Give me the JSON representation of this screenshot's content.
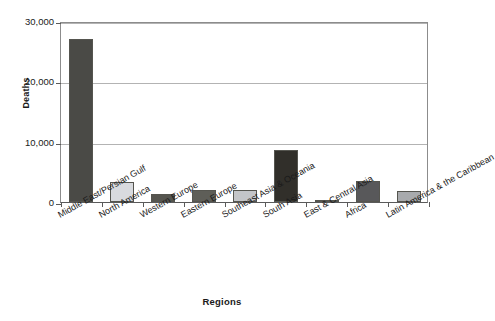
{
  "chart_data": {
    "type": "bar",
    "title": "",
    "xlabel": "Regions",
    "ylabel": "Deaths",
    "ylim": [
      0,
      30000
    ],
    "yticks": [
      0,
      10000,
      20000,
      30000
    ],
    "ytick_labels": [
      "0",
      "10,000",
      "20,000",
      "30,000"
    ],
    "grid": true,
    "legend": "none",
    "categories": [
      "Middle East/Persian Gulf",
      "North America",
      "Western Europe",
      "Eastern Europe",
      "Southeast Asia & Oceania",
      "South Asia",
      "East & Central Asia",
      "Africa",
      "Latin America & the Caribbean"
    ],
    "values": [
      27000,
      3300,
      1400,
      2000,
      2000,
      8600,
      300,
      3500,
      1900
    ],
    "bar_colors": [
      "#4a4a46",
      "#d8dade",
      "#55554f",
      "#5e5e58",
      "#c3c5c8",
      "#312f2a",
      "#3f3d38",
      "#58585a",
      "#a8aaad"
    ]
  },
  "axis": {
    "y_title": "Deaths",
    "x_title": "Regions"
  },
  "colors": {
    "plot_background": "#ffffff",
    "gridline": "#b3b3b3",
    "axis_line": "#5a5a5a",
    "frame": "#8c8c8c",
    "bar_outline": "#55554f"
  }
}
